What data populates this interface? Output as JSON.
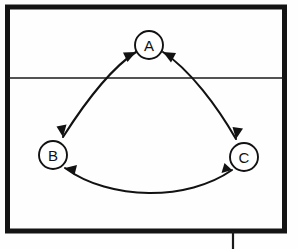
{
  "figure": {
    "type": "cycle-diagram",
    "background_color": "#fefefe",
    "ink_color": "#121212",
    "caption": ""
  },
  "frame": {
    "name": "outer-border",
    "stroke_color": "#141414",
    "stroke_width": 5,
    "x": 7.5,
    "y": 7,
    "width": 277,
    "height": 224,
    "divider": {
      "name": "horizontal-divider",
      "y": 78,
      "x_start": 9,
      "x_end": 284,
      "stroke_color": "#1a1a1a"
    },
    "tick": {
      "name": "bottom-tick-mark",
      "x": 233,
      "y_start": 231,
      "y_end": 249,
      "stroke_color": "#1a1a1a"
    }
  },
  "nodes": [
    {
      "id": "A",
      "label": "A",
      "cx": 149,
      "cy": 45,
      "r": 14
    },
    {
      "id": "B",
      "label": "B",
      "cx": 53,
      "cy": 155,
      "r": 14
    },
    {
      "id": "C",
      "label": "C",
      "cx": 244,
      "cy": 157,
      "r": 14
    }
  ],
  "edges": [
    {
      "id": "AB",
      "from": "A",
      "to": "B",
      "label": "",
      "direction": "bidirectional",
      "curve": "arc-bulging-left",
      "path": "M 136 52 C 108 68 82 104 62 138",
      "arrow_start": {
        "x": 136,
        "y": 52,
        "angle": -152
      },
      "arrow_end": {
        "x": 62,
        "y": 138,
        "angle": 120
      }
    },
    {
      "id": "AC",
      "from": "A",
      "to": "C",
      "label": "",
      "direction": "bidirectional",
      "curve": "arc-bulging-right",
      "path": "M 163 52 C 192 69 218 106 236 140",
      "arrow_start": {
        "x": 163,
        "y": 52,
        "angle": -28
      },
      "arrow_end": {
        "x": 236,
        "y": 140,
        "angle": 62
      }
    },
    {
      "id": "BC",
      "from": "B",
      "to": "C",
      "label": "",
      "direction": "bidirectional",
      "curve": "arc-bulging-down",
      "path": "M 65 168 C 110 200 188 200 232 170",
      "arrow_start": {
        "x": 65,
        "y": 168,
        "angle": 145
      },
      "arrow_end": {
        "x": 232,
        "y": 170,
        "angle": -34
      }
    }
  ]
}
